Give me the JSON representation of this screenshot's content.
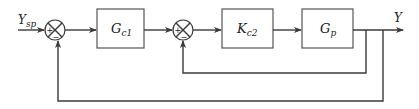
{
  "diagram": {
    "type": "cascade-control-block-diagram",
    "input": {
      "label": "Y",
      "subscript": "sp"
    },
    "output": {
      "label": "Y"
    },
    "summing_junctions": [
      {
        "id": "sum1",
        "signs": {
          "left": "+",
          "bottom": "−"
        }
      },
      {
        "id": "sum2",
        "signs": {
          "left": "+",
          "bottom": "−"
        }
      }
    ],
    "blocks": [
      {
        "id": "gc1",
        "label": "G",
        "subscript": "c1"
      },
      {
        "id": "kc2",
        "label": "K",
        "subscript": "c2"
      },
      {
        "id": "gp",
        "label": "G",
        "subscript": "p"
      }
    ],
    "feedback_loops": [
      {
        "name": "inner",
        "from": "Y",
        "to": "sum2"
      },
      {
        "name": "outer",
        "from": "Y",
        "to": "sum1"
      }
    ],
    "colors": {
      "line": "#3a3a3a",
      "block_border": "#555555",
      "background": "#ffffff"
    }
  }
}
